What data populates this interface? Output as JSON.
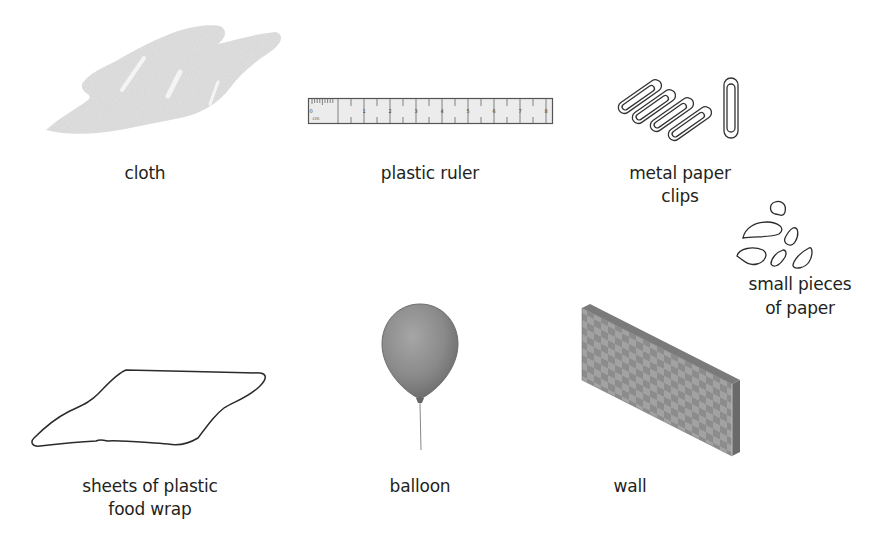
{
  "diagram": {
    "items": [
      {
        "id": "cloth",
        "label": "cloth",
        "icon": "cloth-icon"
      },
      {
        "id": "plastic-ruler",
        "label": "plastic ruler",
        "icon": "ruler-icon",
        "ruler_marks": [
          "0",
          "1",
          "2",
          "3",
          "4",
          "5",
          "6",
          "7",
          "8",
          "9"
        ],
        "ruler_unit": "cm"
      },
      {
        "id": "metal-paper-clips",
        "label_line1": "metal paper",
        "label_line2": "clips",
        "icon": "paper-clip-icon"
      },
      {
        "id": "small-pieces-of-paper",
        "label_line1": "small pieces",
        "label_line2": "of paper",
        "icon": "paper-pieces-icon"
      },
      {
        "id": "plastic-food-wrap",
        "label_line1": "sheets of plastic",
        "label_line2": "food wrap",
        "icon": "plastic-wrap-icon"
      },
      {
        "id": "balloon",
        "label": "balloon",
        "icon": "balloon-icon"
      },
      {
        "id": "wall",
        "label": "wall",
        "icon": "wall-icon"
      }
    ]
  },
  "colors": {
    "text": "#231f20",
    "cloth": "#dcdcdc",
    "balloon": "#8a8a8a",
    "wall_face": "#9a9a9a",
    "wall_side": "#6f6f6f",
    "outline": "#2b2b2b"
  }
}
